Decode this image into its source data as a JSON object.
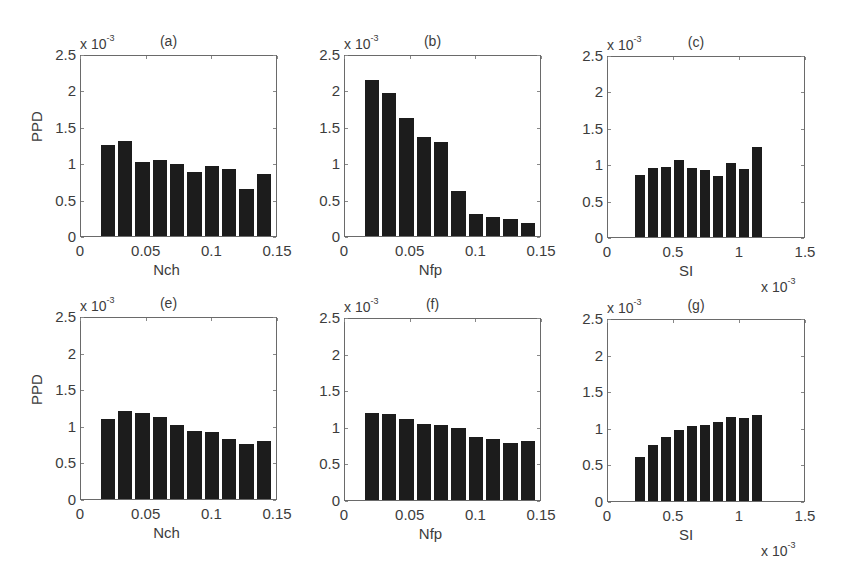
{
  "figure": {
    "exponent_label": "x 10",
    "exponent_sup": "-3",
    "ylabel": "PPD"
  },
  "chart_data": [
    {
      "type": "bar",
      "title": "(a)",
      "xlabel": "Nch",
      "ylabel": "PPD",
      "y_exponent": "x 10^-3",
      "ylim": [
        0,
        2.5
      ],
      "xlim": [
        0,
        0.15
      ],
      "yticks": [
        "0",
        "0.5",
        "1",
        "1.5",
        "2",
        "2.5"
      ],
      "xticks": [
        "0",
        "0.05",
        "0.1",
        "0.15"
      ],
      "bin_range": [
        0.0145,
        0.1485
      ],
      "values": [
        1.27,
        1.33,
        1.04,
        1.06,
        1.0,
        0.9,
        0.98,
        0.93,
        0.66,
        0.86
      ]
    },
    {
      "type": "bar",
      "title": "(b)",
      "xlabel": "Nfp",
      "ylabel": "",
      "y_exponent": "x 10^-3",
      "ylim": [
        0,
        2.5
      ],
      "xlim": [
        0,
        0.15
      ],
      "yticks": [
        "0",
        "0.5",
        "1",
        "1.5",
        "2",
        "2.5"
      ],
      "xticks": [
        "0",
        "0.05",
        "0.1",
        "0.15"
      ],
      "bin_range": [
        0.0145,
        0.1485
      ],
      "values": [
        2.18,
        2.0,
        1.65,
        1.38,
        1.31,
        0.63,
        0.31,
        0.26,
        0.24,
        0.18
      ]
    },
    {
      "type": "bar",
      "title": "(c)",
      "xlabel": "SI",
      "ylabel": "",
      "y_exponent": "x 10^-3",
      "x_exponent": "x 10^-3",
      "ylim": [
        0,
        2.5
      ],
      "xlim": [
        0,
        1.5
      ],
      "yticks": [
        "0",
        "0.5",
        "1",
        "1.5",
        "2",
        "2.5"
      ],
      "xticks": [
        "0",
        "0.5",
        "1",
        "1.5"
      ],
      "bin_range": [
        0.2,
        1.2
      ],
      "values": [
        0.87,
        0.96,
        0.98,
        1.07,
        0.97,
        0.93,
        0.85,
        1.04,
        0.95,
        1.26
      ]
    },
    {
      "type": "bar",
      "title": "(e)",
      "xlabel": "Nch",
      "ylabel": "PPD",
      "y_exponent": "x 10^-3",
      "ylim": [
        0,
        2.5
      ],
      "xlim": [
        0,
        0.15
      ],
      "yticks": [
        "0",
        "0.5",
        "1",
        "1.5",
        "2",
        "2.5"
      ],
      "xticks": [
        "0",
        "0.05",
        "0.1",
        "0.15"
      ],
      "bin_range": [
        0.0145,
        0.1485
      ],
      "values": [
        1.11,
        1.22,
        1.2,
        1.14,
        1.03,
        0.94,
        0.93,
        0.84,
        0.76,
        0.81
      ]
    },
    {
      "type": "bar",
      "title": "(f)",
      "xlabel": "Nfp",
      "ylabel": "",
      "y_exponent": "x 10^-3",
      "ylim": [
        0,
        2.5
      ],
      "xlim": [
        0,
        0.15
      ],
      "yticks": [
        "0",
        "0.5",
        "1",
        "1.5",
        "2",
        "2.5"
      ],
      "xticks": [
        "0",
        "0.05",
        "0.1",
        "0.15"
      ],
      "bin_range": [
        0.0145,
        0.1485
      ],
      "values": [
        1.21,
        1.2,
        1.12,
        1.06,
        1.04,
        1.0,
        0.87,
        0.85,
        0.79,
        0.82
      ]
    },
    {
      "type": "bar",
      "title": "(g)",
      "xlabel": "SI",
      "ylabel": "",
      "y_exponent": "x 10^-3",
      "x_exponent": "x 10^-3",
      "ylim": [
        0,
        2.5
      ],
      "xlim": [
        0,
        1.5
      ],
      "yticks": [
        "0",
        "0.5",
        "1",
        "1.5",
        "2",
        "2.5"
      ],
      "xticks": [
        "0",
        "0.5",
        "1",
        "1.5"
      ],
      "bin_range": [
        0.2,
        1.2
      ],
      "values": [
        0.61,
        0.78,
        0.89,
        0.99,
        1.04,
        1.05,
        1.1,
        1.16,
        1.15,
        1.2
      ]
    }
  ],
  "layout": [
    {
      "left": 80,
      "top": 55,
      "width": 197,
      "height": 182
    },
    {
      "left": 344,
      "top": 55,
      "width": 197,
      "height": 182
    },
    {
      "left": 607,
      "top": 56,
      "width": 198,
      "height": 182
    },
    {
      "left": 80,
      "top": 317,
      "width": 197,
      "height": 183
    },
    {
      "left": 344,
      "top": 318,
      "width": 197,
      "height": 183
    },
    {
      "left": 607,
      "top": 319,
      "width": 198,
      "height": 183
    }
  ]
}
